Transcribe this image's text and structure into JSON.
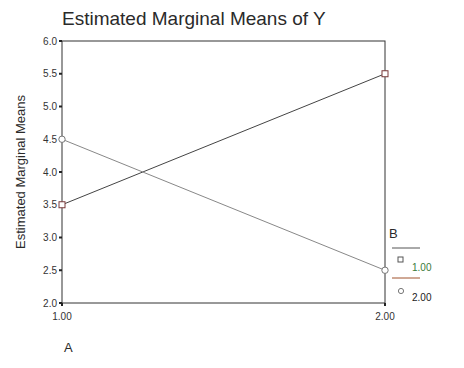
{
  "chart_data": {
    "type": "line",
    "title": "Estimated Marginal Means of Y",
    "xlabel": "A",
    "ylabel": "Estimated Marginal Means",
    "categories": [
      "1.00",
      "2.00"
    ],
    "ylim": [
      2.0,
      6.0
    ],
    "yticks": [
      "2.0",
      "2.5",
      "3.0",
      "3.5",
      "4.0",
      "4.5",
      "5.0",
      "5.5",
      "6.0"
    ],
    "grid": false,
    "legend_title": "B",
    "legend_position": "right",
    "series": [
      {
        "name": "1.00",
        "marker": "square",
        "values": [
          3.5,
          5.5
        ]
      },
      {
        "name": "2.00",
        "marker": "circle",
        "values": [
          4.5,
          2.5
        ]
      }
    ]
  },
  "colors": {
    "axis": "#333333",
    "series1_line": "#444444",
    "series2_line": "#888888",
    "legend_1_text": "#3a7a3a",
    "legend_2_text": "#222222"
  }
}
